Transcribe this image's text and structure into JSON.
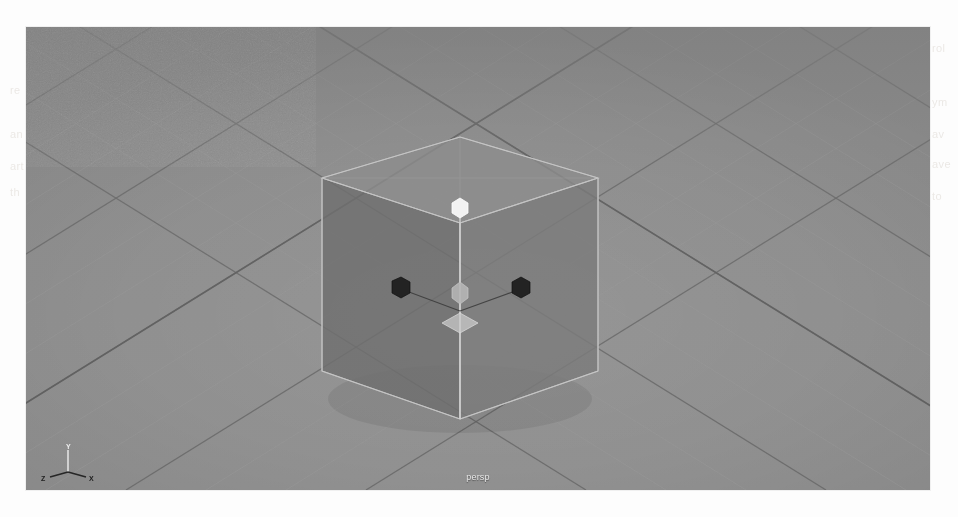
{
  "app": {
    "kind": "3d-viewport",
    "panel_label": "persp"
  },
  "viewport": {
    "camera_label": "persp",
    "background_color": "#8f8f8f",
    "grid": {
      "visible": true,
      "major_line_color": "#6d6d6d",
      "minor_line_color": "#9a9a9a",
      "horizon_visible": false
    }
  },
  "axis_gizmo": {
    "up_label": "Y",
    "left_label": "Z",
    "right_label": "X",
    "up_color": "#e6e6e6",
    "left_color": "#2c2c2c",
    "right_color": "#2c2c2c"
  },
  "object": {
    "name": "pCube1",
    "type": "cube",
    "selected": true,
    "top_face_color": "#8c8c8c",
    "left_face_color": "#6f6f6f",
    "right_face_color": "#7b7b7b",
    "edge_color": "#b9b9b9"
  },
  "manipulator": {
    "tool": "move",
    "y_handle_color": "#f2f2f2",
    "x_handle_color": "#232323",
    "z_handle_color": "#232323",
    "center_handle_color": "#b5b5b5",
    "plane_handle_color": "#c9c9c9",
    "axis_line_color": "#cfcfcf"
  },
  "ghost_text": [
    {
      "text": "re",
      "x": 10,
      "y": 84
    },
    {
      "text": "an",
      "x": 10,
      "y": 128
    },
    {
      "text": "art",
      "x": 10,
      "y": 160
    },
    {
      "text": "th",
      "x": 10,
      "y": 186
    },
    {
      "text": "rol",
      "x": 932,
      "y": 42
    },
    {
      "text": "ym",
      "x": 932,
      "y": 96
    },
    {
      "text": "av",
      "x": 932,
      "y": 128
    },
    {
      "text": "ave",
      "x": 932,
      "y": 158
    },
    {
      "text": "to",
      "x": 932,
      "y": 190
    }
  ]
}
